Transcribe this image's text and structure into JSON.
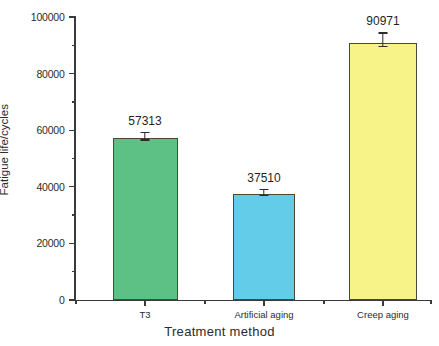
{
  "chart_data": {
    "type": "bar",
    "title": "",
    "xlabel": "Treatment method",
    "ylabel": "Fatigue life/cycles",
    "categories": [
      "T3",
      "Artificial aging",
      "Creep aging"
    ],
    "values": [
      57313,
      37510,
      90971
    ],
    "value_labels": [
      "57313",
      "37510",
      "90971"
    ],
    "errors": [
      2200,
      1700,
      3600
    ],
    "colors": [
      "#5DC185",
      "#63CCE8",
      "#F7F389"
    ],
    "bar_edge_color": "#4a4a33",
    "ylim": [
      0,
      100000
    ],
    "ytick_labels": [
      "0",
      "20000",
      "40000",
      "60000",
      "80000",
      "100000"
    ],
    "ytick_values": [
      0,
      20000,
      40000,
      60000,
      80000,
      100000
    ],
    "yminor_values": [
      10000,
      30000,
      50000,
      70000,
      90000
    ],
    "grid": false,
    "legend": null,
    "axis_color": "#3a3a3a",
    "background": "#ffffff"
  }
}
